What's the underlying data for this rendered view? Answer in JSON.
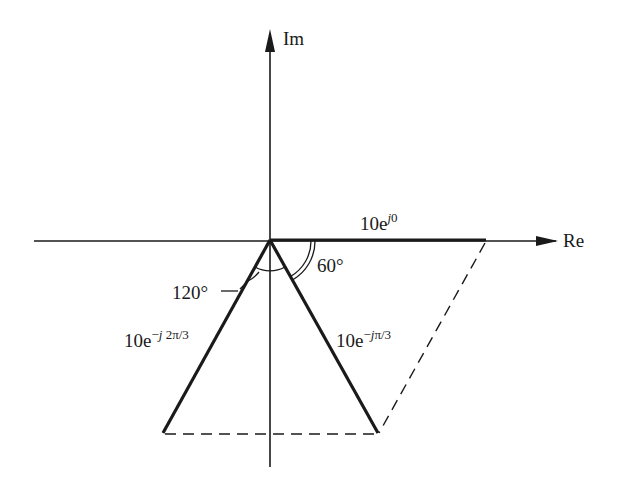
{
  "diagram": {
    "axes": {
      "real_label": "Re",
      "imag_label": "Im"
    },
    "phasors": [
      {
        "name": "phasor-0",
        "magnitude": 10,
        "angle_deg": 0,
        "base": "10e",
        "exp_sign": "",
        "exp_j": "j",
        "exp_rest": "0"
      },
      {
        "name": "phasor-minus-pi-3",
        "magnitude": 10,
        "angle_deg": -60,
        "base": "10e",
        "exp_sign": "−",
        "exp_j": "j",
        "exp_rest": "π/3"
      },
      {
        "name": "phasor-minus-2pi-3",
        "magnitude": 10,
        "angle_deg": -120,
        "base": "10e",
        "exp_sign": "−",
        "exp_j": "j",
        "exp_rest": "2π/3"
      }
    ],
    "angle_labels": {
      "a60": "60°",
      "a120": "120°"
    },
    "colors": {
      "ink": "#1a1a1a",
      "background": "#ffffff"
    }
  }
}
